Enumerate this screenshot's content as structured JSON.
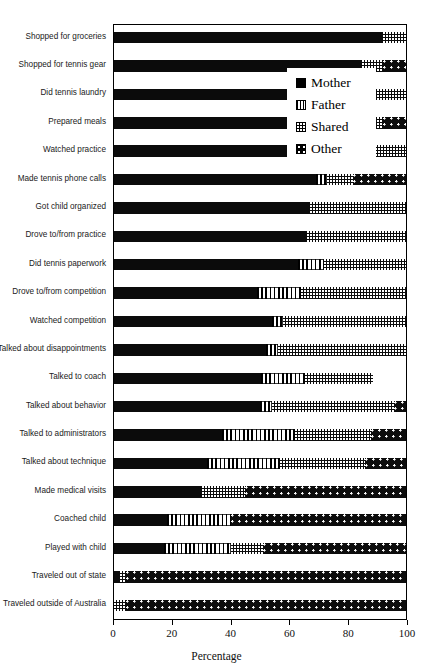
{
  "chart_data": {
    "type": "bar",
    "orientation": "horizontal",
    "stacked": true,
    "title": "",
    "xlabel": "Percentage",
    "ylabel": "",
    "xlim": [
      0,
      100
    ],
    "xticks": [
      0,
      20,
      40,
      60,
      80,
      100
    ],
    "xtick_labels": [
      "0",
      "20",
      "40",
      "60",
      "80",
      "100"
    ],
    "grid": false,
    "legend_position": "upper-center-inset",
    "legend_entries": [
      "Mother",
      "Father",
      "Shared",
      "Other"
    ],
    "categories": [
      "Shopped for groceries",
      "Shopped for tennis gear",
      "Did tennis laundry",
      "Prepared meals",
      "Watched practice",
      "Made tennis phone calls",
      "Got child organized",
      "Drove to/from practice",
      "Did tennis paperwork",
      "Drove to/from competition",
      "Watched competition",
      "Talked about disappointments",
      "Talked to coach",
      "Talked about behavior",
      "Talked to administrators",
      "Talked about technique",
      "Made medical visits",
      "Coached child",
      "Played with child",
      "Traveled out of state",
      "Traveled outside of Australia"
    ],
    "series": [
      {
        "name": "Mother",
        "values": [
          92,
          85,
          84,
          83,
          76,
          69,
          67,
          66,
          63,
          49,
          54,
          52,
          50,
          50,
          37,
          32,
          30,
          18,
          17,
          2,
          0
        ]
      },
      {
        "name": "Father",
        "values": [
          0,
          0,
          0,
          0,
          0,
          4,
          0,
          0,
          9,
          15,
          4,
          4,
          15,
          4,
          25,
          25,
          0,
          22,
          23,
          0,
          0
        ]
      },
      {
        "name": "Shared",
        "values": [
          8,
          7,
          16,
          9,
          24,
          9,
          33,
          34,
          28,
          36,
          42,
          44,
          23,
          42,
          26,
          29,
          15,
          0,
          11,
          2,
          4
        ]
      },
      {
        "name": "Other",
        "values": [
          0,
          8,
          0,
          8,
          0,
          18,
          0,
          0,
          0,
          0,
          0,
          0,
          0,
          4,
          12,
          14,
          55,
          60,
          49,
          96,
          96
        ]
      }
    ]
  },
  "legend": {
    "items": [
      {
        "label": "Mother",
        "key": "mother"
      },
      {
        "label": "Father",
        "key": "father"
      },
      {
        "label": "Shared",
        "key": "shared"
      },
      {
        "label": "Other",
        "key": "other"
      }
    ]
  },
  "axis": {
    "x_title": "Percentage"
  },
  "colors": {
    "ink": "#000000",
    "paper": "#ffffff"
  }
}
